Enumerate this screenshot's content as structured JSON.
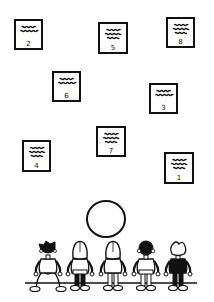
{
  "diagram": {
    "colors": {
      "ink": "#111111",
      "background": "#ffffff"
    },
    "cards": [
      {
        "number": "2",
        "x": 14,
        "y": 19,
        "w": 29,
        "h": 31,
        "lines": 2
      },
      {
        "number": "5",
        "x": 98,
        "y": 22,
        "w": 30,
        "h": 32,
        "lines": 3
      },
      {
        "number": "8",
        "x": 166,
        "y": 17,
        "w": 29,
        "h": 31,
        "lines": 3
      },
      {
        "number": "6",
        "x": 52,
        "y": 71,
        "w": 29,
        "h": 31,
        "lines": 2
      },
      {
        "number": "3",
        "x": 149,
        "y": 83,
        "w": 29,
        "h": 31,
        "lines": 2
      },
      {
        "number": "7",
        "x": 96,
        "y": 126,
        "w": 30,
        "h": 31,
        "lines": 3
      },
      {
        "number": "4",
        "x": 22,
        "y": 140,
        "w": 29,
        "h": 32,
        "lines": 3
      },
      {
        "number": "1",
        "x": 164,
        "y": 152,
        "w": 30,
        "h": 32,
        "lines": 3
      }
    ],
    "circle": {
      "cx": 106,
      "cy": 219,
      "r": 19,
      "label": ""
    },
    "ground_line": {
      "x1": 25,
      "x2": 197,
      "y": 283
    },
    "figures": [
      {
        "id": "child-1",
        "cx": 48,
        "hair": "spiky-dark",
        "body": "white",
        "pose": "wide-stance"
      },
      {
        "id": "child-2",
        "cx": 80,
        "hair": "long-light",
        "body": "white",
        "pose": "standing"
      },
      {
        "id": "child-3",
        "cx": 113,
        "hair": "long-light",
        "body": "white",
        "pose": "standing"
      },
      {
        "id": "child-4",
        "cx": 146,
        "hair": "curly-dark",
        "body": "white",
        "pose": "standing"
      },
      {
        "id": "child-5",
        "cx": 178,
        "hair": "curly-light",
        "body": "black",
        "pose": "standing"
      }
    ]
  }
}
